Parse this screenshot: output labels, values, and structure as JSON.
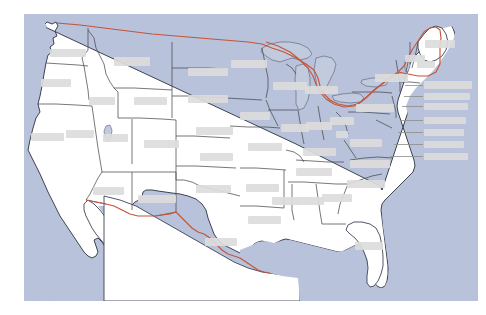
{
  "map": {
    "title": "United States Political Map",
    "region": "Contiguous United States",
    "projection_note": "Lower 48 states with Great Lakes, Baja California and Gulf of Mexico",
    "colors": {
      "ocean": "#b8c2da",
      "lake": "#c2cade",
      "land": "#ffffff",
      "state_border": "#4a4a52",
      "coastline": "#3c4350",
      "international_border": "#c4553a",
      "label_redaction": "#dcdcdc",
      "page_background": "#ffffff"
    },
    "water_bodies": [
      {
        "name": "Pacific Ocean",
        "side": "west"
      },
      {
        "name": "Atlantic Ocean",
        "side": "east"
      },
      {
        "name": "Gulf of Mexico",
        "side": "south"
      },
      {
        "name": "Lake Superior",
        "side": "north-central"
      },
      {
        "name": "Lake Michigan",
        "side": "north-central"
      },
      {
        "name": "Lake Huron",
        "side": "north-central"
      },
      {
        "name": "Lake Erie",
        "side": "northeast"
      },
      {
        "name": "Lake Ontario",
        "side": "northeast"
      }
    ],
    "international_borders": [
      {
        "name": "United States - Canada border",
        "color": "#c4553a"
      },
      {
        "name": "United States - Mexico border",
        "color": "#c4553a"
      }
    ],
    "state_labels": [
      {
        "name": "label-washington",
        "x": 50,
        "y": 49,
        "w": 36,
        "h": 8
      },
      {
        "name": "label-oregon",
        "x": 41,
        "y": 79,
        "w": 30,
        "h": 8
      },
      {
        "name": "label-idaho",
        "x": 89,
        "y": 97,
        "w": 26,
        "h": 8
      },
      {
        "name": "label-montana",
        "x": 114,
        "y": 57,
        "w": 36,
        "h": 9
      },
      {
        "name": "label-wyoming",
        "x": 134,
        "y": 97,
        "w": 33,
        "h": 8
      },
      {
        "name": "label-north-dakota",
        "x": 188,
        "y": 68,
        "w": 40,
        "h": 8
      },
      {
        "name": "label-south-dakota",
        "x": 188,
        "y": 95,
        "w": 40,
        "h": 8
      },
      {
        "name": "label-nebraska",
        "x": 196,
        "y": 127,
        "w": 37,
        "h": 8
      },
      {
        "name": "label-california",
        "x": 31,
        "y": 133,
        "w": 33,
        "h": 8
      },
      {
        "name": "label-nevada",
        "x": 66,
        "y": 130,
        "w": 28,
        "h": 8
      },
      {
        "name": "label-utah",
        "x": 103,
        "y": 134,
        "w": 25,
        "h": 8
      },
      {
        "name": "label-colorado",
        "x": 144,
        "y": 140,
        "w": 35,
        "h": 8
      },
      {
        "name": "label-kansas",
        "x": 200,
        "y": 153,
        "w": 33,
        "h": 8
      },
      {
        "name": "label-arizona",
        "x": 93,
        "y": 187,
        "w": 31,
        "h": 8
      },
      {
        "name": "label-new-mexico",
        "x": 138,
        "y": 195,
        "w": 38,
        "h": 8
      },
      {
        "name": "label-oklahoma",
        "x": 196,
        "y": 185,
        "w": 35,
        "h": 8
      },
      {
        "name": "label-texas",
        "x": 205,
        "y": 238,
        "w": 32,
        "h": 8
      },
      {
        "name": "label-minnesota",
        "x": 231,
        "y": 60,
        "w": 36,
        "h": 8
      },
      {
        "name": "label-iowa",
        "x": 240,
        "y": 112,
        "w": 30,
        "h": 8
      },
      {
        "name": "label-missouri",
        "x": 248,
        "y": 143,
        "w": 34,
        "h": 8
      },
      {
        "name": "label-arkansas",
        "x": 246,
        "y": 184,
        "w": 33,
        "h": 8
      },
      {
        "name": "label-louisiana",
        "x": 248,
        "y": 216,
        "w": 33,
        "h": 8
      },
      {
        "name": "label-wisconsin",
        "x": 273,
        "y": 82,
        "w": 34,
        "h": 8
      },
      {
        "name": "label-illinois",
        "x": 281,
        "y": 124,
        "w": 28,
        "h": 8
      },
      {
        "name": "label-michigan",
        "x": 305,
        "y": 86,
        "w": 33,
        "h": 8
      },
      {
        "name": "label-indiana",
        "x": 306,
        "y": 122,
        "w": 26,
        "h": 8
      },
      {
        "name": "label-ohio",
        "x": 330,
        "y": 117,
        "w": 24,
        "h": 8
      },
      {
        "name": "label-kentucky",
        "x": 303,
        "y": 148,
        "w": 33,
        "h": 8
      },
      {
        "name": "label-tennessee",
        "x": 296,
        "y": 168,
        "w": 36,
        "h": 8
      },
      {
        "name": "label-mississippi",
        "x": 272,
        "y": 197,
        "w": 27,
        "h": 8
      },
      {
        "name": "label-alabama",
        "x": 297,
        "y": 197,
        "w": 27,
        "h": 8
      },
      {
        "name": "label-georgia",
        "x": 322,
        "y": 194,
        "w": 30,
        "h": 8
      },
      {
        "name": "label-florida",
        "x": 355,
        "y": 242,
        "w": 28,
        "h": 8
      },
      {
        "name": "label-south-carolina",
        "x": 347,
        "y": 180,
        "w": 38,
        "h": 8
      },
      {
        "name": "label-north-carolina",
        "x": 350,
        "y": 160,
        "w": 40,
        "h": 8
      },
      {
        "name": "label-virginia",
        "x": 350,
        "y": 139,
        "w": 32,
        "h": 8
      },
      {
        "name": "label-west-virginia",
        "x": 336,
        "y": 131,
        "w": 12,
        "h": 7
      },
      {
        "name": "label-pennsylvania",
        "x": 356,
        "y": 104,
        "w": 38,
        "h": 8
      },
      {
        "name": "label-new-york",
        "x": 375,
        "y": 74,
        "w": 33,
        "h": 8
      },
      {
        "name": "label-vermont",
        "x": 405,
        "y": 55,
        "w": 20,
        "h": 7
      },
      {
        "name": "label-new-hampshire",
        "x": 417,
        "y": 61,
        "w": 18,
        "h": 7
      },
      {
        "name": "label-maine",
        "x": 425,
        "y": 40,
        "w": 30,
        "h": 8
      },
      {
        "name": "label-massachusetts",
        "x": 424,
        "y": 81,
        "w": 48,
        "h": 8
      },
      {
        "name": "label-rhode-island",
        "x": 424,
        "y": 93,
        "w": 46,
        "h": 7
      },
      {
        "name": "label-connecticut",
        "x": 424,
        "y": 103,
        "w": 44,
        "h": 7
      },
      {
        "name": "label-new-jersey",
        "x": 424,
        "y": 117,
        "w": 42,
        "h": 7
      },
      {
        "name": "label-delaware",
        "x": 424,
        "y": 129,
        "w": 40,
        "h": 7
      },
      {
        "name": "label-maryland",
        "x": 424,
        "y": 141,
        "w": 40,
        "h": 7
      },
      {
        "name": "label-district-of-columbia",
        "x": 424,
        "y": 153,
        "w": 44,
        "h": 7
      }
    ],
    "leader_lines": [
      {
        "name": "leader-massachusetts",
        "x": 405,
        "y": 85,
        "w": 18
      },
      {
        "name": "leader-rhode-island",
        "x": 404,
        "y": 96,
        "w": 19
      },
      {
        "name": "leader-connecticut",
        "x": 402,
        "y": 106,
        "w": 21
      },
      {
        "name": "leader-new-jersey",
        "x": 400,
        "y": 120,
        "w": 23
      },
      {
        "name": "leader-delaware",
        "x": 398,
        "y": 132,
        "w": 25
      },
      {
        "name": "leader-maryland",
        "x": 394,
        "y": 144,
        "w": 29
      },
      {
        "name": "leader-dc",
        "x": 390,
        "y": 156,
        "w": 33
      }
    ]
  }
}
